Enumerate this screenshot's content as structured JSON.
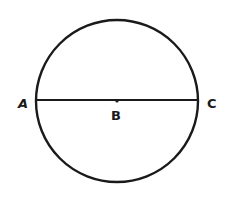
{
  "diagram": {
    "type": "geometry",
    "circle": {
      "cx": 117,
      "cy": 101,
      "r": 81,
      "stroke": "#1a1a1a"
    },
    "diameter": {
      "x1": 36,
      "y1": 100,
      "x2": 198,
      "y2": 100
    },
    "points": [
      {
        "id": "A",
        "label": "A",
        "x": 25,
        "y": 107
      },
      {
        "id": "B",
        "label": "B",
        "x": 117,
        "y": 118
      },
      {
        "id": "C",
        "label": "C",
        "x": 213,
        "y": 107
      }
    ]
  }
}
